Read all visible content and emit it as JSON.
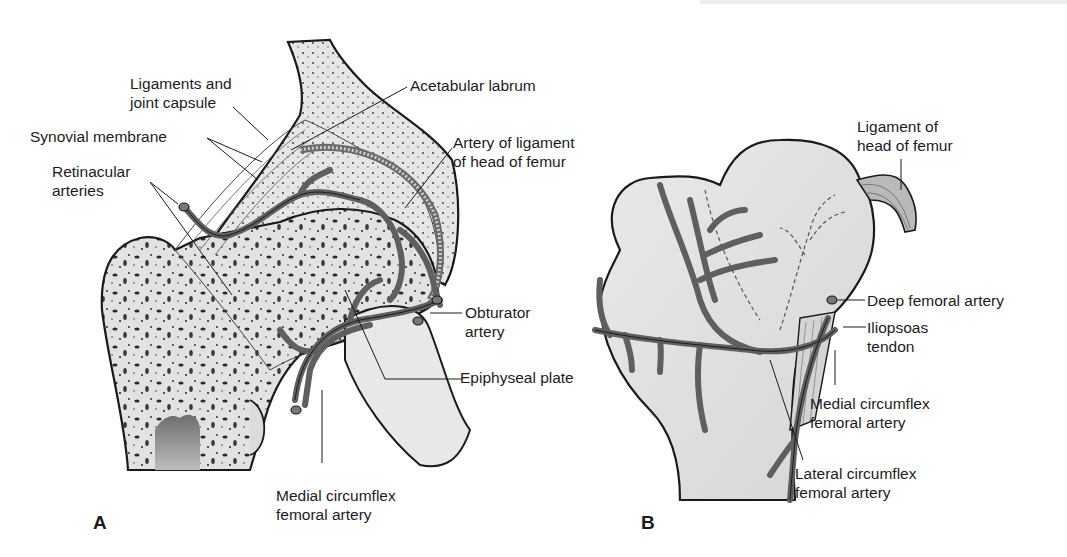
{
  "figure": {
    "panels": [
      {
        "id": "A",
        "letter": "A",
        "labels": {
          "ligaments": "Ligaments and\njoint capsule",
          "synovial": "Synovial membrane",
          "retinacular": "Retinacular\narteries",
          "acetabular": "Acetabular labrum",
          "artery_ligament": "Artery of ligament\nof head of femur",
          "obturator": "Obturator\nartery",
          "epiphyseal": "Epiphyseal plate",
          "medial_circumflex": "Medial circumflex\nfemoral artery"
        }
      },
      {
        "id": "B",
        "letter": "B",
        "labels": {
          "ligament_head": "Ligament of\nhead of femur",
          "deep_femoral": "Deep femoral artery",
          "iliopsoas": "Iliopsoas\ntendon",
          "medial_circumflex": "Medial circumflex\nfemoral artery",
          "lateral_circumflex": "Lateral circumflex\nfemoral artery"
        }
      }
    ],
    "colors": {
      "bone_fill": "#e4e4e4",
      "outline": "#1a1a1a",
      "artery": "#5f5f5f",
      "marrow": "#7a7a7a",
      "text": "#1c1c1c"
    }
  }
}
